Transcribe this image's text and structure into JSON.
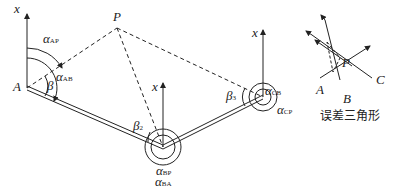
{
  "labels": {
    "x_A": "x",
    "x_B": "x",
    "x_C": "x",
    "x_tri": "x",
    "A": "A",
    "P": "P",
    "alpha_AP": "α",
    "alpha_AP_sub": "AP",
    "alpha_AB": "α",
    "alpha_AB_sub": "AB",
    "beta": "β",
    "beta2": "β",
    "beta2_sub": "2",
    "beta3": "β",
    "beta3_sub": "3",
    "alpha_CB": "α",
    "alpha_CB_sub": "CB",
    "alpha_CP": "α",
    "alpha_CP_sub": "CP",
    "alpha_BP": "α",
    "alpha_BP_sub": "BP",
    "alpha_BA": "α",
    "alpha_BA_sub": "BA",
    "tri_P": "P",
    "tri_A": "A",
    "tri_B": "B",
    "tri_C": "C"
  },
  "caption": "误差三角形"
}
